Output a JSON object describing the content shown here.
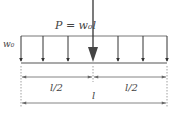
{
  "diagram": {
    "point_load_label": "P = w₀l",
    "distributed_load_label": "w₀",
    "half_span_left_label": "l/2",
    "half_span_right_label": "l/2",
    "span_label": "l",
    "colors": {
      "line": "#555555",
      "arrow": "#333333",
      "dim": "#666666"
    }
  }
}
